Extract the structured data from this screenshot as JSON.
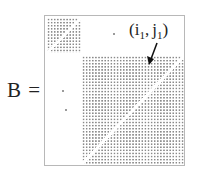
{
  "figure": {
    "matrix_label": "B =",
    "annotation": {
      "open": "(",
      "i": "i",
      "i_sub": "1",
      "sep": ",",
      "j": "j",
      "j_sub": "1",
      "close": ")"
    }
  }
}
